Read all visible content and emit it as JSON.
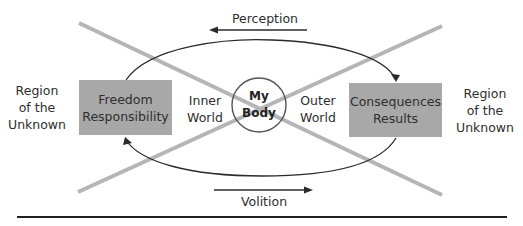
{
  "diagram": {
    "title": "",
    "arrows": {
      "top": {
        "label": "Perception",
        "direction": "left"
      },
      "bottom": {
        "label": "Volition",
        "direction": "right"
      }
    },
    "regions": {
      "left": {
        "line1": "Region",
        "line2": "of the",
        "line3": "Unknown"
      },
      "right": {
        "line1": "Region",
        "line2": "of the",
        "line3": "Unknown"
      }
    },
    "boxes": {
      "left": {
        "line1": "Freedom",
        "line2": "Responsibility"
      },
      "right": {
        "line1": "Consequences",
        "line2": "Results"
      }
    },
    "worlds": {
      "inner": {
        "line1": "Inner",
        "line2": "World"
      },
      "outer": {
        "line1": "Outer",
        "line2": "World"
      }
    },
    "center": {
      "line1": "My",
      "line2": "Body"
    },
    "colors": {
      "box_fill": "#a8a8a8",
      "cross_lines": "#b5b5b5",
      "ink": "#2a2a2a"
    }
  }
}
